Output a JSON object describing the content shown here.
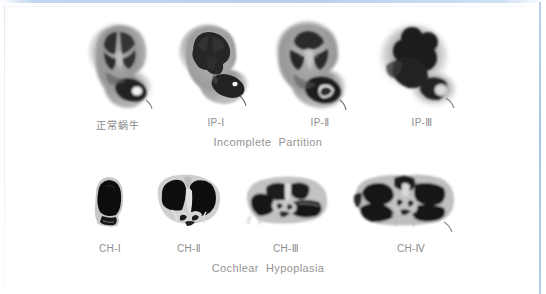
{
  "figure": {
    "background_color": "#ffffff",
    "border_color": "#b0c8e8",
    "label_color": "#8e8e8e",
    "group_label_color": "#949494"
  },
  "rows": [
    {
      "group_label_part1": "Incomplete",
      "group_label_part2": "Partition",
      "group_caption_x": 268,
      "group_caption_y": 136,
      "items": [
        {
          "label": "正常蜗牛",
          "is_cjk": true,
          "label_x": 118,
          "label_y": 117,
          "img_x": 82,
          "img_y": 16,
          "img_w": 78,
          "img_h": 96,
          "shape": "normal-cochlea"
        },
        {
          "label": "IP-Ⅰ",
          "is_cjk": false,
          "label_x": 216,
          "label_y": 117,
          "img_x": 176,
          "img_y": 18,
          "img_w": 78,
          "img_h": 94,
          "shape": "ip-1"
        },
        {
          "label": "IP-Ⅱ",
          "is_cjk": false,
          "label_x": 320,
          "label_y": 117,
          "img_x": 270,
          "img_y": 16,
          "img_w": 82,
          "img_h": 96,
          "shape": "ip-2"
        },
        {
          "label": "IP-Ⅲ",
          "is_cjk": false,
          "label_x": 422,
          "label_y": 117,
          "img_x": 372,
          "img_y": 18,
          "img_w": 86,
          "img_h": 94,
          "shape": "ip-3"
        }
      ]
    },
    {
      "group_label_part1": "Cochlear",
      "group_label_part2": "Hypoplasia",
      "group_caption_x": 268,
      "group_caption_y": 262,
      "items": [
        {
          "label": "CH-Ⅰ",
          "is_cjk": false,
          "label_x": 110,
          "label_y": 243,
          "img_x": 84,
          "img_y": 172,
          "img_w": 50,
          "img_h": 62,
          "shape": "ch-1"
        },
        {
          "label": "CH-Ⅱ",
          "is_cjk": false,
          "label_x": 189,
          "label_y": 243,
          "img_x": 152,
          "img_y": 170,
          "img_w": 74,
          "img_h": 64,
          "shape": "ch-2"
        },
        {
          "label": "CH-Ⅲ",
          "is_cjk": false,
          "label_x": 286,
          "label_y": 243,
          "img_x": 243,
          "img_y": 172,
          "img_w": 88,
          "img_h": 62,
          "shape": "ch-3"
        },
        {
          "label": "CH-Ⅳ",
          "is_cjk": false,
          "label_x": 411,
          "label_y": 243,
          "img_x": 352,
          "img_y": 170,
          "img_w": 106,
          "img_h": 66,
          "shape": "ch-4"
        }
      ]
    }
  ]
}
